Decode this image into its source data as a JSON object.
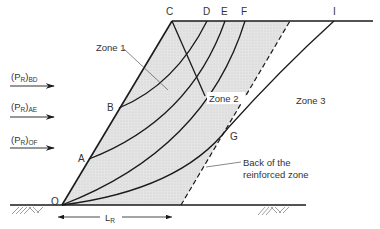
{
  "figure": {
    "type": "diagram"
  },
  "points": {
    "O": {
      "label": "O"
    },
    "A": {
      "label": "A"
    },
    "B": {
      "label": "B"
    },
    "C": {
      "label": "C"
    },
    "D": {
      "label": "D"
    },
    "E": {
      "label": "E"
    },
    "F": {
      "label": "F"
    },
    "G": {
      "label": "G"
    },
    "I": {
      "label": "I"
    }
  },
  "zones": {
    "zone1": "Zone 1",
    "zone2": "Zone 2",
    "zone3": "Zone 3"
  },
  "forces": [
    {
      "main": "(P",
      "sub_r": "R",
      "close": ")",
      "sub": "BD"
    },
    {
      "main": "(P",
      "sub_r": "R",
      "close": ")",
      "sub": "AE"
    },
    {
      "main": "(P",
      "sub_r": "R",
      "close": ")",
      "sub": "OF"
    }
  ],
  "annotation": {
    "back_line1": "Back of the",
    "back_line2": "reinforced zone"
  },
  "dimension": {
    "main": "L",
    "sub": "R"
  },
  "colors": {
    "fill": "#e2e2e2",
    "line": "#1a1a1a",
    "text": "#333333"
  }
}
